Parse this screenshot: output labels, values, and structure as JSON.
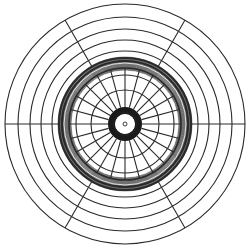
{
  "diagram": {
    "type": "polar-grid",
    "width": 248,
    "height": 246,
    "center": {
      "x": 125,
      "y": 124
    },
    "stroke_color": "#2a2a2a",
    "background": "#ffffff",
    "outer_rings": [
      120,
      107,
      95,
      84,
      73
    ],
    "outer_spoke_angles_deg": [
      0,
      60,
      120,
      180,
      240,
      300
    ],
    "outer_spoke_range": [
      66,
      120
    ],
    "band": {
      "inner": 54,
      "outer": 67,
      "count": 28,
      "bold_outer": [
        66,
        63
      ],
      "bold_inner": [
        56
      ]
    },
    "inner_rings": [
      49,
      34
    ],
    "inner_spoke_step_deg": 15,
    "inner_spoke_range": [
      17,
      56
    ],
    "hub": {
      "outer": 17,
      "inner": 10,
      "ring_count": 7
    },
    "center_dot": {
      "radius": 2
    }
  }
}
